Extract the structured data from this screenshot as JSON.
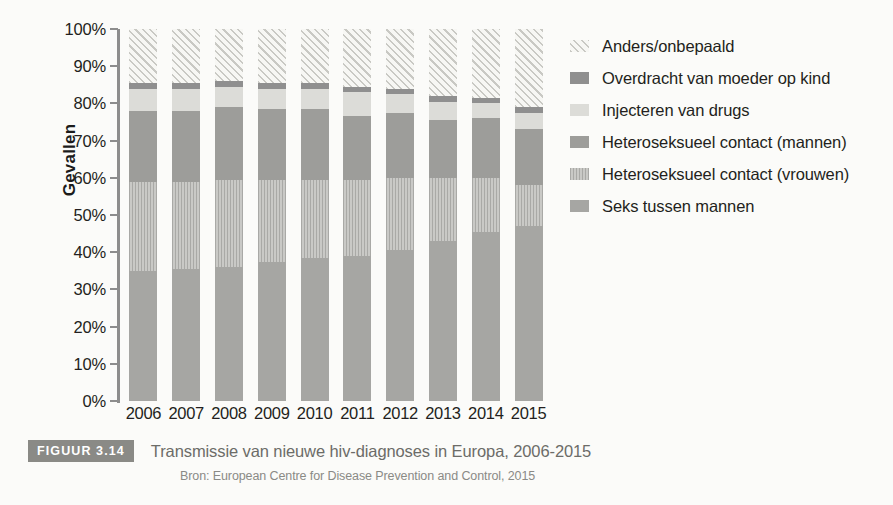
{
  "figure": {
    "badge": "FIGUUR 3.14",
    "title": "Transmissie van nieuwe hiv-diagnoses in Europa, 2006-2015",
    "source": "Bron: European Centre for Disease Prevention and Control, 2015"
  },
  "chart_data": {
    "type": "bar",
    "stacked": true,
    "stack_total": 100,
    "title": "Transmissie van nieuwe hiv-diagnoses in Europa, 2006-2015",
    "xlabel": "",
    "ylabel": "Gevallen",
    "ylim": [
      0,
      100
    ],
    "yticks": [
      0,
      10,
      20,
      30,
      40,
      50,
      60,
      70,
      80,
      90,
      100
    ],
    "ytick_labels": [
      "0%",
      "10%",
      "20%",
      "30%",
      "40%",
      "50%",
      "60%",
      "70%",
      "80%",
      "90%",
      "100%"
    ],
    "grid": false,
    "legend_position": "right",
    "categories": [
      "2006",
      "2007",
      "2008",
      "2009",
      "2010",
      "2011",
      "2012",
      "2013",
      "2014",
      "2015"
    ],
    "series": [
      {
        "name": "Seks tussen mannen",
        "key": "msm",
        "color": "#a6a6a3",
        "pattern": "solid",
        "values": [
          35,
          35.5,
          36,
          37.5,
          38.5,
          39,
          40.5,
          43,
          45.5,
          47
        ]
      },
      {
        "name": "Heteroseksueel contact (vrouwen)",
        "key": "hetv",
        "color": "#bdbdba",
        "pattern": "vertical-stripes",
        "values": [
          24,
          23.5,
          23.5,
          22,
          21,
          20.5,
          19.5,
          17,
          14.5,
          11
        ]
      },
      {
        "name": "Heteroseksueel contact (mannen)",
        "key": "hetm",
        "color": "#9d9d9a",
        "pattern": "solid",
        "values": [
          19,
          19,
          19.5,
          19,
          19,
          17,
          17.5,
          15.5,
          16,
          15
        ]
      },
      {
        "name": "Injecteren van drugs",
        "key": "idu",
        "color": "#dcdcd8",
        "pattern": "solid",
        "values": [
          6,
          6,
          5.5,
          5.5,
          5.5,
          6.5,
          5,
          5,
          4,
          4.5
        ]
      },
      {
        "name": "Overdracht van moeder op kind",
        "key": "mtc",
        "color": "#8f8f8f",
        "pattern": "solid",
        "values": [
          1.5,
          1.5,
          1.5,
          1.5,
          1.5,
          1.5,
          1.5,
          1.5,
          1.5,
          1.5
        ]
      },
      {
        "name": "Anders/onbepaald",
        "key": "other",
        "color": "#f2f2ef",
        "pattern": "diagonal-hatch",
        "values": [
          14.5,
          14.5,
          14,
          14.5,
          14.5,
          15.5,
          16,
          18,
          18.5,
          21
        ]
      }
    ],
    "legend": [
      "Anders/onbepaald",
      "Overdracht van moeder op kind",
      "Injecteren van drugs",
      "Heteroseksueel contact (mannen)",
      "Heteroseksueel contact (vrouwen)",
      "Seks tussen mannen"
    ]
  }
}
